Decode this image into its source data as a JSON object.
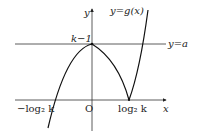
{
  "diagram": {
    "type": "function-graph",
    "axes": {
      "x_label": "x",
      "y_label": "y",
      "origin_label": "O"
    },
    "curve_label": "y=g(x)",
    "line_label": "y=a",
    "y_tick_label": "k−1",
    "x_tick_labels": {
      "left": "−log₂ k",
      "right": "log₂ k"
    }
  }
}
